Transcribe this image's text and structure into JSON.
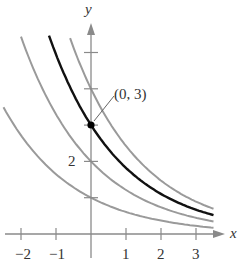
{
  "chart_data": {
    "type": "line",
    "title": "",
    "xlabel": "x",
    "ylabel": "y",
    "xlim": [
      -2.3,
      3.7
    ],
    "ylim": [
      0,
      5.6
    ],
    "x_ticks": [
      -2,
      -1,
      1,
      2,
      3
    ],
    "x_tick_labels": [
      "−2",
      "−1",
      "1",
      "2",
      "3"
    ],
    "y_ticks": [
      1,
      2,
      3,
      4,
      5
    ],
    "y_tick_labels": [
      "",
      "2",
      "",
      "",
      ""
    ],
    "grid": false,
    "series": [
      {
        "name": "y = 4e^(-x/2)",
        "color": "#9a9a9a",
        "C": 4,
        "k": 0.5,
        "x_range": [
          -0.65,
          3.5
        ]
      },
      {
        "name": "y = 3e^(-x/2)",
        "color": "#111111",
        "C": 3,
        "k": 0.5,
        "x_range": [
          -1.2,
          3.5
        ],
        "highlight": true
      },
      {
        "name": "y = 2e^(-x/2)",
        "color": "#9a9a9a",
        "C": 2,
        "k": 0.5,
        "x_range": [
          -2.0,
          3.5
        ]
      },
      {
        "name": "y = e^(-x/2)",
        "color": "#9a9a9a",
        "C": 1,
        "k": 0.5,
        "x_range": [
          -2.5,
          3.5
        ]
      }
    ],
    "annotations": [
      {
        "text": "(0, 3)",
        "point": [
          0,
          3
        ]
      }
    ]
  },
  "labels": {
    "x_axis": "x",
    "y_axis": "y",
    "point": "(0, 3)",
    "x_ticks": [
      "−2",
      "−1",
      "1",
      "2",
      "3"
    ],
    "y_tick_2": "2"
  }
}
